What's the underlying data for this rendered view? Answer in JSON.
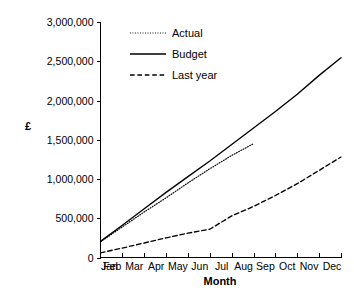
{
  "chart_data": {
    "type": "line",
    "title": "",
    "xlabel": "Month",
    "ylabel": "£",
    "categories": [
      "Jan",
      "Feb",
      "Mar",
      "Apr",
      "May",
      "Jun",
      "Jul",
      "Aug",
      "Sep",
      "Oct",
      "Nov",
      "Dec"
    ],
    "ylim": [
      0,
      3000000
    ],
    "xlim": [
      0,
      11
    ],
    "ytick_labels": [
      "0",
      "500,000",
      "1,000,000",
      "1,500,000",
      "2,000,000",
      "2,500,000",
      "3,000,000"
    ],
    "ytick_values": [
      0,
      500000,
      1000000,
      1500000,
      2000000,
      2500000,
      3000000
    ],
    "grid": false,
    "legend_position": "upper-left-inside",
    "series": [
      {
        "name": "Actual",
        "style": "dotted",
        "color": "#000000",
        "x": [
          "Jan",
          "Feb",
          "Mar",
          "Apr",
          "May",
          "Jun",
          "Jul",
          "Aug"
        ],
        "values": [
          200000,
          390000,
          580000,
          760000,
          950000,
          1130000,
          1300000,
          1450000
        ]
      },
      {
        "name": "Budget",
        "style": "solid",
        "color": "#000000",
        "x": [
          "Jan",
          "Feb",
          "Mar",
          "Apr",
          "May",
          "Jun",
          "Jul",
          "Aug",
          "Sep",
          "Oct",
          "Nov",
          "Dec"
        ],
        "values": [
          205000,
          410000,
          620000,
          830000,
          1030000,
          1230000,
          1440000,
          1650000,
          1860000,
          2080000,
          2320000,
          2545000
        ]
      },
      {
        "name": "Last year",
        "style": "dashed",
        "color": "#000000",
        "x": [
          "Jan",
          "Feb",
          "Mar",
          "Apr",
          "May",
          "Jun",
          "Jul",
          "Aug",
          "Sep",
          "Oct",
          "Nov",
          "Dec"
        ],
        "values": [
          60000,
          120000,
          185000,
          250000,
          310000,
          360000,
          530000,
          650000,
          790000,
          940000,
          1110000,
          1280000
        ]
      }
    ]
  },
  "legend": {
    "items": [
      {
        "label": "Actual",
        "style": "dotted"
      },
      {
        "label": "Budget",
        "style": "solid"
      },
      {
        "label": "Last year",
        "style": "dashed"
      }
    ]
  },
  "axes": {
    "y_title": "£",
    "x_title": "Month"
  }
}
